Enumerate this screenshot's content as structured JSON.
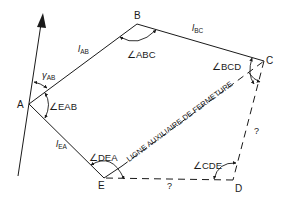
{
  "figure": {
    "type": "traverse-closure-diagram",
    "vertices": {
      "A": "A",
      "B": "B",
      "C": "C",
      "D": "D",
      "E": "E"
    },
    "sides": {
      "AB": {
        "symbol": "l",
        "subscript": "AB",
        "style": "solid"
      },
      "BC": {
        "symbol": "l",
        "subscript": "BC",
        "style": "solid"
      },
      "EA": {
        "symbol": "l",
        "subscript": "EA",
        "style": "solid"
      },
      "CD": {
        "label": "?",
        "style": "dashed"
      },
      "DE": {
        "label": "?",
        "style": "dashed"
      },
      "CE": {
        "label": "LIGNE AUXILIAIRE DE FERMETURE",
        "style": "solid-with-dashed-underline"
      }
    },
    "azimuth": {
      "symbol": "γ",
      "subscript": "AB"
    },
    "angles": {
      "ABC": "∠ABC",
      "BCD": "∠BCD",
      "CDE": "∠CDE",
      "DEA": "∠DEA",
      "EAB": "∠EAB"
    },
    "north_arrow": {
      "icon": "north-arrow-icon"
    }
  }
}
